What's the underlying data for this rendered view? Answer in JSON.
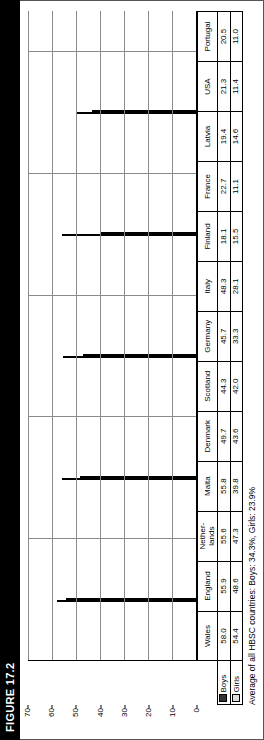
{
  "figure": {
    "banner_label": "FIGURE 17.2"
  },
  "legend": {
    "boys_label": "Boys",
    "girls_label": "Girls",
    "boys_color": "#333333",
    "girls_color": "#dcdcdc"
  },
  "caption": {
    "text": "Average of all HBSC countries: Boys: 34.3%, Girls: 23.9%"
  },
  "axis": {
    "ticks": [
      "70",
      "60",
      "50",
      "40",
      "30",
      "20",
      "10",
      "0"
    ]
  },
  "chart_data": {
    "type": "bar",
    "title": "FIGURE 17.2",
    "xlabel": "",
    "ylabel": "",
    "ylim": [
      0,
      70
    ],
    "grid": true,
    "legend_position": "table-row-headers",
    "categories": [
      "Wales",
      "England",
      "Nether-\nlands",
      "Malta",
      "Denmark",
      "Scotland",
      "Germany",
      "Italy",
      "Finland",
      "France",
      "Latvia",
      "USA",
      "Portugal"
    ],
    "series": [
      {
        "name": "Boys",
        "color": "#333333",
        "values": [
          58.0,
          55.9,
          55.6,
          55.8,
          49.7,
          44.3,
          45.7,
          48.3,
          18.1,
          22.7,
          19.4,
          21.3,
          20.5
        ]
      },
      {
        "name": "Girls",
        "color": "#c9c9c9",
        "values": [
          54.4,
          48.6,
          47.3,
          39.8,
          43.6,
          42.0,
          33.3,
          28.1,
          15.5,
          11.1,
          14.6,
          11.4,
          11.0
        ]
      }
    ],
    "annotations": [
      "Average of all HBSC countries: Boys: 34.3%, Girls: 23.9%"
    ]
  },
  "table": {
    "columns": [
      {
        "label": "Wales",
        "boys": "58.0",
        "girls": "54.4"
      },
      {
        "label": "England",
        "boys": "55.9",
        "girls": "48.6"
      },
      {
        "label": "Nether-\nlands",
        "boys": "55.6",
        "girls": "47.3"
      },
      {
        "label": "Malta",
        "boys": "55.8",
        "girls": "39.8"
      },
      {
        "label": "Denmark",
        "boys": "49.7",
        "girls": "43.6"
      },
      {
        "label": "Scotland",
        "boys": "44.3",
        "girls": "42.0"
      },
      {
        "label": "Germany",
        "boys": "45.7",
        "girls": "33.3"
      },
      {
        "label": "Italy",
        "boys": "48.3",
        "girls": "28.1"
      },
      {
        "label": "Finland",
        "boys": "18.1",
        "girls": "15.5"
      },
      {
        "label": "France",
        "boys": "22.7",
        "girls": "11.1"
      },
      {
        "label": "Latvia",
        "boys": "19.4",
        "girls": "14.6"
      },
      {
        "label": "USA",
        "boys": "21.3",
        "girls": "11.4"
      },
      {
        "label": "Portugal",
        "boys": "20.5",
        "girls": "11.0"
      }
    ]
  }
}
